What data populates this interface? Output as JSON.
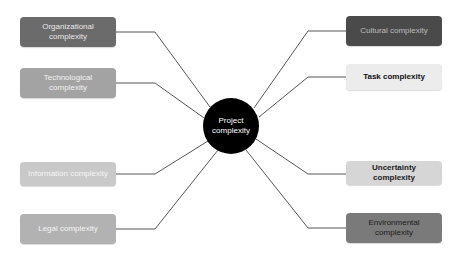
{
  "diagram": {
    "type": "hub-and-spoke",
    "center": {
      "line1": "Project",
      "line2": "complexity",
      "x": 231,
      "y": 126,
      "r": 28,
      "fill": "#000000",
      "text_color": "#ffffff"
    },
    "nodes": [
      {
        "id": "organizational",
        "line1": "Organizational",
        "line2": "complexity",
        "side": "left",
        "x": 20,
        "y": 17,
        "w": 96,
        "h": 30,
        "fill": "#6b6b6b",
        "text_color": "#e8e8e8",
        "bold": false
      },
      {
        "id": "technological",
        "line1": "Technological",
        "line2": "complexity",
        "side": "left",
        "x": 20,
        "y": 68,
        "w": 96,
        "h": 30,
        "fill": "#a3a3a3",
        "text_color": "#f2f2f2",
        "bold": false
      },
      {
        "id": "information",
        "line1": "Information complexity",
        "line2": "",
        "side": "left",
        "x": 20,
        "y": 162,
        "w": 96,
        "h": 24,
        "fill": "#c9c9c9",
        "text_color": "#f5f5f5",
        "bold": false
      },
      {
        "id": "legal",
        "line1": "Legal complexity",
        "line2": "",
        "side": "left",
        "x": 20,
        "y": 214,
        "w": 96,
        "h": 30,
        "fill": "#b2b2b2",
        "text_color": "#f5f5f5",
        "bold": false
      },
      {
        "id": "cultural",
        "line1": "Cultural complexity",
        "line2": "",
        "side": "right",
        "x": 346,
        "y": 16,
        "w": 96,
        "h": 30,
        "fill": "#4a4a4a",
        "text_color": "#bdbdbd",
        "bold": false
      },
      {
        "id": "task",
        "line1": "Task complexity",
        "line2": "",
        "side": "right",
        "x": 346,
        "y": 64,
        "w": 96,
        "h": 26,
        "fill": "#ececec",
        "text_color": "#111111",
        "bold": true
      },
      {
        "id": "uncertainty",
        "line1": "Uncertainty complexity",
        "line2": "",
        "side": "right",
        "x": 346,
        "y": 161,
        "w": 96,
        "h": 24,
        "fill": "#d6d6d6",
        "text_color": "#222222",
        "bold": true
      },
      {
        "id": "environmental",
        "line1": "Environmental",
        "line2": "complexity",
        "side": "right",
        "x": 346,
        "y": 213,
        "w": 96,
        "h": 30,
        "fill": "#7a7a7a",
        "text_color": "#1a1a1a",
        "bold": false
      }
    ],
    "edges": [
      {
        "to": "organizational",
        "points": [
          [
            116,
            32
          ],
          [
            155,
            32
          ],
          [
            210,
            107
          ]
        ]
      },
      {
        "to": "technological",
        "points": [
          [
            116,
            83
          ],
          [
            155,
            83
          ],
          [
            204,
            118
          ]
        ]
      },
      {
        "to": "information",
        "points": [
          [
            116,
            174
          ],
          [
            155,
            174
          ],
          [
            208,
            141
          ]
        ]
      },
      {
        "to": "legal",
        "points": [
          [
            116,
            229
          ],
          [
            155,
            229
          ],
          [
            218,
            150
          ]
        ]
      },
      {
        "to": "cultural",
        "points": [
          [
            346,
            31
          ],
          [
            308,
            31
          ],
          [
            254,
            108
          ]
        ]
      },
      {
        "to": "task",
        "points": [
          [
            346,
            77
          ],
          [
            308,
            77
          ],
          [
            259,
            117
          ]
        ]
      },
      {
        "to": "uncertainty",
        "points": [
          [
            346,
            174
          ],
          [
            308,
            174
          ],
          [
            256,
            139
          ]
        ]
      },
      {
        "to": "environmental",
        "points": [
          [
            346,
            228
          ],
          [
            308,
            228
          ],
          [
            246,
            150
          ]
        ]
      }
    ],
    "line_color": "#555555"
  }
}
